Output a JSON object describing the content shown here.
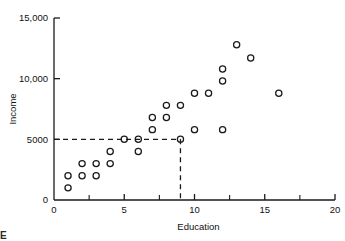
{
  "chart_data": {
    "type": "scatter",
    "title": "",
    "xlabel": "Education",
    "ylabel": "Income",
    "xlim": [
      0,
      20
    ],
    "ylim": [
      0,
      15000
    ],
    "grid": false,
    "legend": null,
    "marker": "open-circle",
    "xticks": [
      0,
      5,
      10,
      15,
      20
    ],
    "xtick_labels": [
      "0",
      "5",
      "10",
      "15",
      "20"
    ],
    "xminor_ticks": [
      2.5,
      7.5,
      12.5,
      17.5
    ],
    "yticks": [
      0,
      5000,
      10000,
      15000
    ],
    "ytick_labels": [
      "0",
      "5000",
      "10,000",
      "15,000"
    ],
    "points": [
      {
        "x": 1,
        "y": 1000
      },
      {
        "x": 1,
        "y": 2000
      },
      {
        "x": 2,
        "y": 2000
      },
      {
        "x": 3,
        "y": 2000
      },
      {
        "x": 2,
        "y": 3000
      },
      {
        "x": 3,
        "y": 3000
      },
      {
        "x": 4,
        "y": 3000
      },
      {
        "x": 4,
        "y": 4000
      },
      {
        "x": 6,
        "y": 4000
      },
      {
        "x": 5,
        "y": 5000
      },
      {
        "x": 6,
        "y": 5000
      },
      {
        "x": 9,
        "y": 5000
      },
      {
        "x": 7,
        "y": 5800
      },
      {
        "x": 10,
        "y": 5800
      },
      {
        "x": 12,
        "y": 5800
      },
      {
        "x": 7,
        "y": 6800
      },
      {
        "x": 8,
        "y": 6800
      },
      {
        "x": 8,
        "y": 7800
      },
      {
        "x": 9,
        "y": 7800
      },
      {
        "x": 10,
        "y": 8800
      },
      {
        "x": 11,
        "y": 8800
      },
      {
        "x": 16,
        "y": 8800
      },
      {
        "x": 12,
        "y": 9800
      },
      {
        "x": 12,
        "y": 10800
      },
      {
        "x": 14,
        "y": 11700
      },
      {
        "x": 13,
        "y": 12800
      }
    ],
    "annotations": [
      {
        "name": "guideline-horizontal",
        "style": "dashed",
        "from": {
          "x": 0,
          "y": 5000
        },
        "to": {
          "x": 9,
          "y": 5000
        }
      },
      {
        "name": "guideline-vertical",
        "style": "dashed",
        "from": {
          "x": 9,
          "y": 5000
        },
        "to": {
          "x": 9,
          "y": 0
        }
      }
    ]
  },
  "caption": {
    "text": "E"
  }
}
